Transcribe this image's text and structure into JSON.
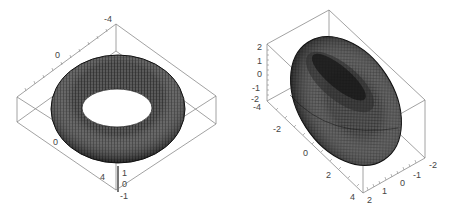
{
  "figure": {
    "panels": [
      {
        "id": "left",
        "description": "Ring torus, view from above",
        "axis_labels": {
          "top": "-4",
          "upper_edge": "0",
          "lower_edge": "0",
          "bottom_edge": "4",
          "z_top": "1",
          "z_mid": "0",
          "z_bottom": "-1"
        }
      },
      {
        "id": "right",
        "description": "Tilted torus, oblique view",
        "axis_labels": {
          "z_2": "2",
          "z_1": "1",
          "z_0": "0",
          "z_m1": "-1",
          "z_m2": "-2",
          "y_m4": "-4",
          "y_m2": "-2",
          "y_0": "0",
          "y_2": "2",
          "y_4": "4",
          "x_2": "2",
          "x_1": "1",
          "x_0": "0",
          "x_m1": "-1",
          "x_m2": "-2"
        }
      }
    ]
  },
  "colors": {
    "surface_dark": "#1a1a1a",
    "surface_mid": "#555555",
    "mesh": "#000000",
    "box": "#8a8a8a",
    "background": "#ffffff"
  }
}
